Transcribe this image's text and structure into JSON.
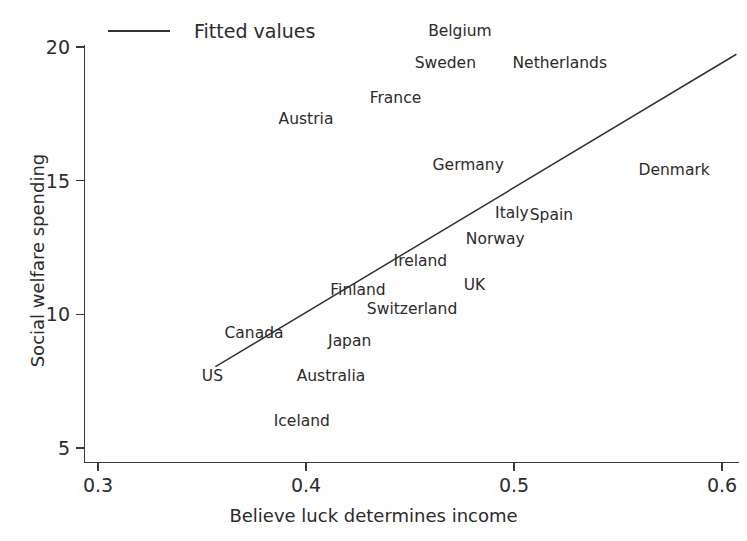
{
  "chart_data": {
    "type": "scatter",
    "title": "",
    "xlabel": "Believe luck determines income",
    "ylabel": "Social welfare spending",
    "xlim": [
      0.3,
      0.61
    ],
    "ylim": [
      4.4,
      20.6
    ],
    "xticks": [
      "0.3",
      "0.4",
      "0.5",
      "0.6"
    ],
    "xtick_values": [
      0.3,
      0.4,
      0.5,
      0.6
    ],
    "yticks": [
      "5",
      "10",
      "15",
      "20"
    ],
    "ytick_values": [
      5,
      10,
      15,
      20
    ],
    "grid": false,
    "legend_position": "top-left",
    "legend": [
      {
        "label": "Fitted values",
        "marker": "line",
        "color": "#333333"
      }
    ],
    "point_label_mode": "text-only",
    "points": [
      {
        "label": "Belgium",
        "x": 0.474,
        "y": 20.6
      },
      {
        "label": "Sweden",
        "x": 0.467,
        "y": 19.4
      },
      {
        "label": "Netherlands",
        "x": 0.522,
        "y": 19.4
      },
      {
        "label": "France",
        "x": 0.443,
        "y": 18.1
      },
      {
        "label": "Austria",
        "x": 0.4,
        "y": 17.3
      },
      {
        "label": "Germany",
        "x": 0.478,
        "y": 15.6
      },
      {
        "label": "Denmark",
        "x": 0.577,
        "y": 15.4
      },
      {
        "label": "Italy",
        "x": 0.499,
        "y": 13.8
      },
      {
        "label": "Spain",
        "x": 0.518,
        "y": 13.7
      },
      {
        "label": "Norway",
        "x": 0.491,
        "y": 12.8
      },
      {
        "label": "Ireland",
        "x": 0.455,
        "y": 12.0
      },
      {
        "label": "UK",
        "x": 0.481,
        "y": 11.1
      },
      {
        "label": "Finland",
        "x": 0.425,
        "y": 10.9
      },
      {
        "label": "Switzerland",
        "x": 0.451,
        "y": 10.2
      },
      {
        "label": "Canada",
        "x": 0.375,
        "y": 9.3
      },
      {
        "label": "Japan",
        "x": 0.421,
        "y": 9.0
      },
      {
        "label": "Australia",
        "x": 0.412,
        "y": 7.7
      },
      {
        "label": "US",
        "x": 0.355,
        "y": 7.7
      },
      {
        "label": "Iceland",
        "x": 0.398,
        "y": 6.0
      }
    ],
    "fit_line": {
      "name": "Fitted values",
      "color": "#333333",
      "x": [
        0.3567,
        0.6067
      ],
      "y": [
        8.05,
        19.72
      ]
    }
  }
}
